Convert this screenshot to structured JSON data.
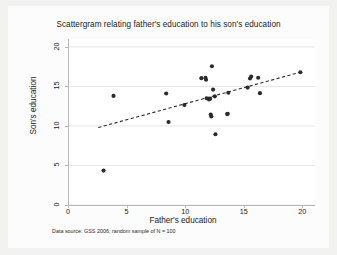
{
  "chart_data": {
    "type": "scatter",
    "title": "Scattergram relating father's education to his son's education",
    "xlabel": "Father's education",
    "ylabel": "Son's education",
    "note": "Data source: GSS 2006; random sample of N = 100",
    "xlim": [
      0,
      21
    ],
    "ylim": [
      0,
      21
    ],
    "xticks": [
      0,
      5,
      10,
      15,
      20
    ],
    "yticks": [
      0,
      5,
      10,
      15,
      20
    ],
    "xtick_labels": [
      "0",
      "5",
      "10",
      "15",
      "20"
    ],
    "ytick_labels": [
      "0",
      "5",
      "10",
      "15",
      "20"
    ],
    "grid": true,
    "grid_axis": "y",
    "legend": "none",
    "marker_color": "#2b2b2b",
    "marker_size": 3,
    "points": [
      {
        "x": 2.95,
        "y": 4.35
      },
      {
        "x": 3.8,
        "y": 13.8
      },
      {
        "x": 8.3,
        "y": 14.1
      },
      {
        "x": 8.5,
        "y": 10.5
      },
      {
        "x": 9.85,
        "y": 12.65
      },
      {
        "x": 11.3,
        "y": 16.05
      },
      {
        "x": 11.65,
        "y": 16.1
      },
      {
        "x": 11.7,
        "y": 15.85
      },
      {
        "x": 11.75,
        "y": 13.5
      },
      {
        "x": 11.95,
        "y": 13.35
      },
      {
        "x": 12.05,
        "y": 13.45
      },
      {
        "x": 12.1,
        "y": 11.45
      },
      {
        "x": 12.15,
        "y": 11.2
      },
      {
        "x": 12.2,
        "y": 17.55
      },
      {
        "x": 12.3,
        "y": 14.6
      },
      {
        "x": 12.45,
        "y": 13.75
      },
      {
        "x": 12.5,
        "y": 8.95
      },
      {
        "x": 13.5,
        "y": 11.5
      },
      {
        "x": 13.55,
        "y": 11.55
      },
      {
        "x": 13.6,
        "y": 14.2
      },
      {
        "x": 15.25,
        "y": 14.85
      },
      {
        "x": 15.45,
        "y": 16.0
      },
      {
        "x": 15.55,
        "y": 16.25
      },
      {
        "x": 16.15,
        "y": 16.1
      },
      {
        "x": 16.3,
        "y": 14.15
      },
      {
        "x": 19.75,
        "y": 16.8
      }
    ],
    "fit_line": {
      "style": "dashed",
      "color": "#2b2b2b",
      "x0": 2.5,
      "y0": 9.8,
      "x1": 19.75,
      "y1": 16.8
    }
  }
}
